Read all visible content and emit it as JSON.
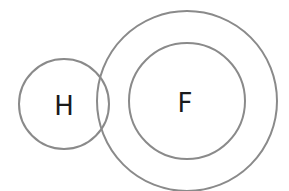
{
  "diagram": {
    "type": "atom-shell-diagram",
    "stroke_color": "#8a8a8a",
    "text_color": "#1a1a1a",
    "atoms": [
      {
        "symbol": "H",
        "shells": 1
      },
      {
        "symbol": "F",
        "shells": 2
      }
    ]
  }
}
